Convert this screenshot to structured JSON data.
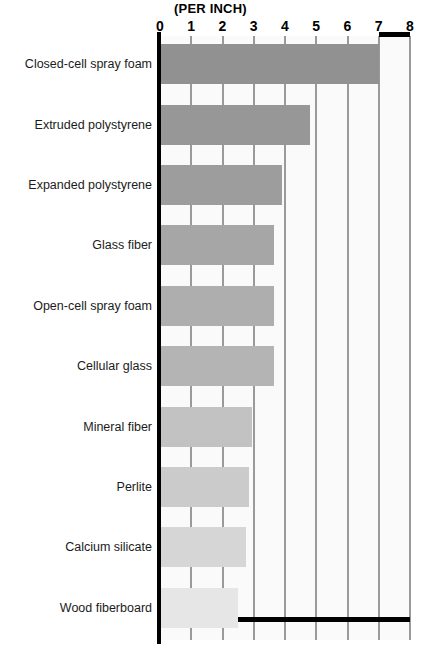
{
  "chart_data": {
    "type": "bar",
    "orientation": "horizontal",
    "title": "(PER INCH)",
    "subtitle": "",
    "xlabel": "",
    "ylabel": "",
    "xlim": [
      0,
      8
    ],
    "grid": true,
    "legend": null,
    "xticks": [
      "0",
      "1",
      "2",
      "3",
      "4",
      "5",
      "6",
      "7",
      "8"
    ],
    "xtick_values": [
      0,
      1,
      2,
      3,
      4,
      5,
      6,
      7,
      8
    ],
    "categories": [
      "Closed-cell spray foam",
      "Extruded polystyrene",
      "Expanded polystyrene",
      "Glass fiber",
      "Open-cell spray foam",
      "Cellular glass",
      "Mineral fiber",
      "Perlite",
      "Calcium silicate",
      "Wood fiberboard"
    ],
    "values": [
      7.0,
      4.8,
      3.9,
      3.65,
      3.65,
      3.65,
      2.95,
      2.85,
      2.75,
      2.5
    ],
    "bar_colors": [
      "#919191",
      "#979797",
      "#9d9d9d",
      "#a6a6a6",
      "#aeaeae",
      "#b4b4b4",
      "#c2c2c2",
      "#cbcbcb",
      "#d6d6d6",
      "#e6e6e6"
    ],
    "panel_color": "#fafafa",
    "gridline_color": "#9a9a9a",
    "axis_color": "#000000"
  }
}
